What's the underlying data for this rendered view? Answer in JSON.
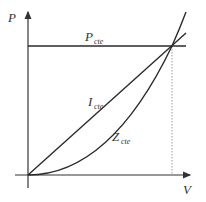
{
  "diagram": {
    "axes": {
      "y_label": "P",
      "x_label": "V"
    },
    "curves": [
      {
        "id": "p_cte",
        "label_main": "P",
        "label_sub": "cte",
        "shape": "horizontal line"
      },
      {
        "id": "i_cte",
        "label_main": "I",
        "label_sub": "cte",
        "shape": "straight line through origin"
      },
      {
        "id": "z_cte",
        "label_main": "Z",
        "label_sub": "cte",
        "shape": "parabola through origin"
      }
    ],
    "annotations": {
      "intersection": "all three curves meet at rated voltage; dotted drop line to V axis"
    },
    "colors": {
      "line": "#2a2a2a",
      "axis": "#333333",
      "dotted": "#9a9a9a"
    }
  }
}
